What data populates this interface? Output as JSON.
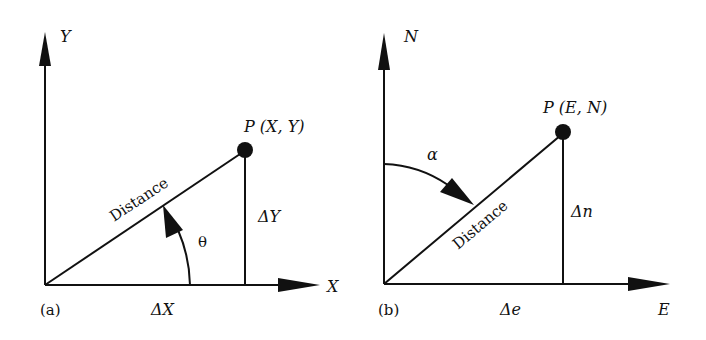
{
  "figure": {
    "panels": [
      {
        "id": "a",
        "tag": "(a)",
        "axis_vertical": "Y",
        "axis_horizontal": "X",
        "point_label": "P (X, Y)",
        "line_label": "Distance",
        "angle_label": "θ",
        "delta_vertical": "ΔY",
        "delta_horizontal": "ΔX"
      },
      {
        "id": "b",
        "tag": "(b)",
        "axis_vertical": "N",
        "axis_horizontal": "E",
        "point_label": "P (E, N)",
        "line_label": "Distance",
        "angle_label": "α",
        "delta_vertical": "Δn",
        "delta_horizontal": "Δe"
      }
    ],
    "colors": {
      "ink": "#111111",
      "background": "#ffffff"
    }
  }
}
